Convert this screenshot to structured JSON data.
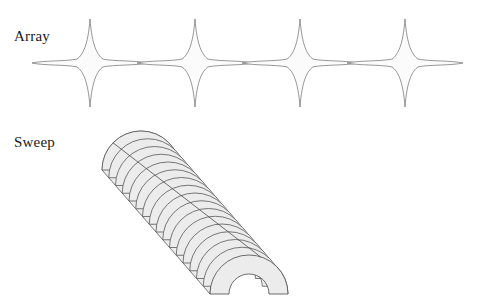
{
  "figure": {
    "background_color": "#ffffff",
    "width": 479,
    "height": 308
  },
  "labels": {
    "array": "Array",
    "sweep": "Sweep",
    "text_color": "#1a1a1a",
    "font_size_px": 15
  },
  "array_diagram": {
    "name": "Array",
    "shape": "four-pointed-star",
    "count": 4,
    "fill_color": "#fbfbfb",
    "stroke_color": "#6b6b6b",
    "stroke_width": 0.7,
    "center_y": 63,
    "centers_x": [
      90,
      195,
      300,
      405
    ],
    "point_up_length": 44,
    "point_down_length": 44,
    "point_side_length": 58,
    "waist_radius": 13
  },
  "sweep_diagram": {
    "name": "Sweep",
    "shape": "semicircular-arch-profile",
    "profile_slice_count": 17,
    "fill_color": "#ececec",
    "stroke_color": "#585858",
    "stroke_width": 0.8,
    "ridge_stroke_color": "#4a4a4a",
    "outer_radius": 39,
    "inner_radius": 20,
    "start_center": {
      "x": 141,
      "y": 170
    },
    "end_center": {
      "x": 249,
      "y": 294
    },
    "step_dx": 6.75,
    "step_dy": 7.75,
    "sweep_direction": "top-left to bottom-right diagonal"
  }
}
